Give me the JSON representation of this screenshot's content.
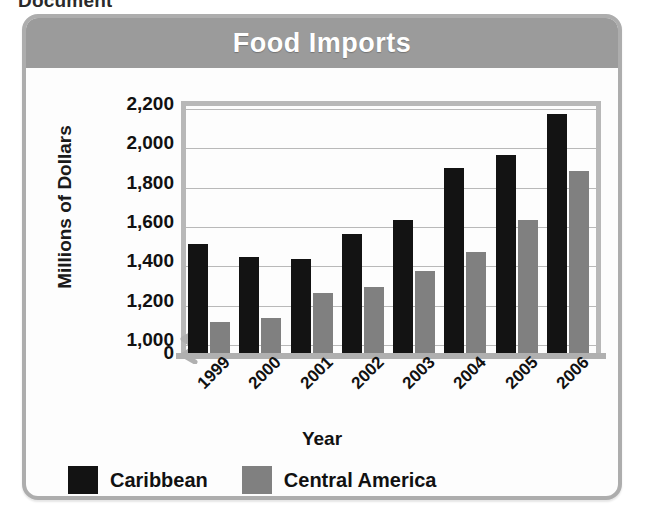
{
  "scan": {
    "top_fragment": "Document"
  },
  "figure": {
    "title": "Food Imports"
  },
  "chart_data": {
    "type": "bar",
    "title": "Food Imports",
    "xlabel": "Year",
    "ylabel": "Millions of Dollars",
    "categories": [
      "1999",
      "2000",
      "2001",
      "2002",
      "2003",
      "2004",
      "2005",
      "2006"
    ],
    "series": [
      {
        "name": "Caribbean",
        "color": "#131313",
        "values": [
          1490,
          1420,
          1410,
          1540,
          1610,
          1875,
          1940,
          2150
        ]
      },
      {
        "name": "Central America",
        "color": "#808080",
        "values": [
          1090,
          1110,
          1240,
          1270,
          1350,
          1450,
          1610,
          1860
        ]
      }
    ],
    "ylim": [
      0,
      2200
    ],
    "yticks": [
      "0",
      "1,000",
      "1,200",
      "1,400",
      "1,600",
      "1,800",
      "2,000",
      "2,200"
    ],
    "ytick_values": [
      0,
      1000,
      1200,
      1400,
      1600,
      1800,
      2000,
      2200
    ],
    "axis_break": true,
    "axis_break_between": [
      0,
      1000
    ],
    "grid": "horizontal",
    "legend_position": "bottom-left",
    "xtick_rotation": -45
  },
  "colors": {
    "banner": "#9b9b9b",
    "frame": "#adadad",
    "caribbean": "#131313",
    "central_america": "#808080",
    "gridline": "#b9b9b9"
  }
}
